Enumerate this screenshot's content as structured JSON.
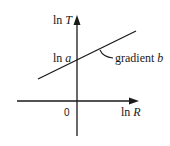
{
  "diagram": {
    "type": "log-log linear relationship",
    "y_axis_label_fn": "ln",
    "y_axis_label_var": "T",
    "x_axis_label_fn": "ln",
    "x_axis_label_var": "R",
    "origin_label": "0",
    "intercept_label_fn": "ln",
    "intercept_label_var": "a",
    "slope_label_text": "gradient",
    "slope_label_var": "b",
    "line_color": "#1a1a1a"
  }
}
